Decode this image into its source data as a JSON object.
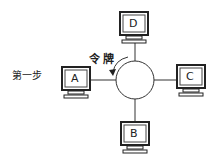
{
  "diagram": {
    "type": "token-ring-network",
    "step_label": "第一步",
    "token_label": "令牌",
    "ring": {
      "cx": 135,
      "cy": 80,
      "r": 19
    },
    "nodes": [
      {
        "id": "D",
        "label": "D",
        "position": "top"
      },
      {
        "id": "A",
        "label": "A",
        "position": "left"
      },
      {
        "id": "C",
        "label": "C",
        "position": "right"
      },
      {
        "id": "B",
        "label": "B",
        "position": "bottom"
      }
    ],
    "colors": {
      "line": "#222222",
      "screen_fill": "#ffffff",
      "background": "#ffffff"
    }
  }
}
